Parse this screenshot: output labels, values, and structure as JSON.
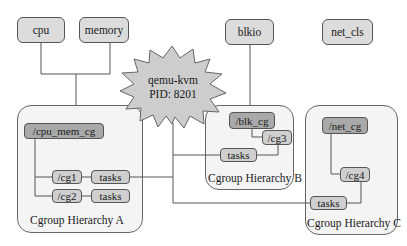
{
  "subsystems": {
    "cpu": "cpu",
    "memory": "memory",
    "blkio": "blkio",
    "net_cls": "net_cls"
  },
  "process": {
    "name": "qemu-kvm",
    "pid_label": "PID: 8201"
  },
  "hierarchy_a": {
    "label": "Cgroup Hierarchy A",
    "root": "/cpu_mem_cg",
    "children": [
      {
        "name": "/cg1",
        "tasks": "tasks"
      },
      {
        "name": "/cg2",
        "tasks": "tasks"
      }
    ]
  },
  "hierarchy_b": {
    "label": "Cgroup Hierarchy B",
    "root": "/blk_cg",
    "children": [
      {
        "name": "/cg3",
        "tasks": "tasks"
      }
    ]
  },
  "hierarchy_c": {
    "label": "Cgroup Hierarchy C",
    "root": "/net_cg",
    "children": [
      {
        "name": "/cg4",
        "tasks": "tasks"
      }
    ]
  },
  "colors": {
    "subsystem_fill": "#dcdcdc",
    "hierarchy_fill": "#f4f4f4",
    "root_cgroup_fill": "#a9a9a9",
    "child_cgroup_fill": "#cfcfcf",
    "star_fill": "#cdcdcd",
    "line": "#555555"
  }
}
